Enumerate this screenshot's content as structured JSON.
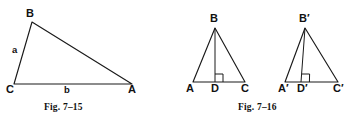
{
  "sheet": {
    "background_color": "#ffffff",
    "ink_color": "#1a1a1a",
    "width": 357,
    "height": 120
  },
  "figures": [
    {
      "id": "fig-7-15",
      "caption": "Fig. 7–15",
      "type": "scalene-triangle",
      "vertices": [
        {
          "name": "B",
          "label": "B",
          "x": 32,
          "y": 22
        },
        {
          "name": "C",
          "label": "C",
          "x": 14,
          "y": 84
        },
        {
          "name": "A",
          "label": "A",
          "x": 132,
          "y": 84
        }
      ],
      "side_labels": [
        {
          "name": "a",
          "label": "a",
          "side": "CB"
        },
        {
          "name": "b",
          "label": "b",
          "side": "CA"
        }
      ]
    },
    {
      "id": "fig-7-16",
      "caption": "Fig. 7–16",
      "type": "two-triangles-with-altitudes",
      "triangles": [
        {
          "name": "triangle-ABC",
          "vertices": [
            {
              "name": "B",
              "label": "B",
              "x": 37,
              "y": 28
            },
            {
              "name": "A",
              "label": "A",
              "x": 15,
              "y": 82
            },
            {
              "name": "D",
              "label": "D",
              "x": 37,
              "y": 82
            },
            {
              "name": "C",
              "label": "C",
              "x": 67,
              "y": 82
            }
          ],
          "altitude": "BD",
          "right_angle_at": "D"
        },
        {
          "name": "triangle-A-prime-B-prime-C-prime",
          "vertices": [
            {
              "name": "B-prime",
              "label": "B′",
              "x": 127,
              "y": 28
            },
            {
              "name": "A-prime",
              "label": "A′",
              "x": 107,
              "y": 82
            },
            {
              "name": "D-prime",
              "label": "D′",
              "x": 123,
              "y": 82
            },
            {
              "name": "C-prime",
              "label": "C′",
              "x": 160,
              "y": 82
            }
          ],
          "altitude": "B′D′",
          "right_angle_at": "D-prime"
        }
      ]
    }
  ]
}
